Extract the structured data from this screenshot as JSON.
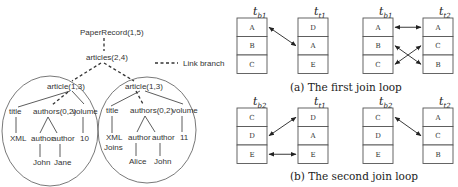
{
  "tree": {
    "root": "PaperRecord(1,5)",
    "articles": "articles(2,4)",
    "legend_label": "Link branch",
    "left": {
      "article": "article(1,3)",
      "title": "title",
      "authors": "authors(0,2)",
      "volume": "volume",
      "title_value": [
        "XML"
      ],
      "author1": "author",
      "author2": "author",
      "volume_value": "10",
      "author1_value": "John",
      "author2_value": "Jane"
    },
    "right": {
      "article": "article(1,3)",
      "title": "title",
      "authors": "authors(0,2)",
      "volume": "volume",
      "title_value": [
        "XML",
        "Joins"
      ],
      "author1": "author",
      "author2": "author",
      "volume_value": "11",
      "author1_value": "Alice",
      "author2_value": "John"
    }
  },
  "join_loops": [
    {
      "caption": "(a) The first join loop",
      "pairs": [
        {
          "left": {
            "name": "t",
            "sub": "b1",
            "rows": [
              "A",
              "B",
              "C"
            ]
          },
          "right": {
            "name": "t",
            "sub": "t1",
            "rows": [
              "D",
              "A",
              "E"
            ]
          },
          "links": [
            [
              0,
              1
            ]
          ]
        },
        {
          "left": {
            "name": "t",
            "sub": "b1",
            "rows": [
              "A",
              "B",
              "C"
            ]
          },
          "right": {
            "name": "t",
            "sub": "t2",
            "rows": [
              "A",
              "C",
              "B"
            ]
          },
          "links": [
            [
              0,
              0
            ],
            [
              1,
              2
            ],
            [
              2,
              1
            ]
          ]
        }
      ]
    },
    {
      "caption": "(b) The second join loop",
      "pairs": [
        {
          "left": {
            "name": "t",
            "sub": "b2",
            "rows": [
              "C",
              "D",
              "E"
            ]
          },
          "right": {
            "name": "t",
            "sub": "t1",
            "rows": [
              "D",
              "A",
              "E"
            ]
          },
          "links": [
            [
              1,
              0
            ],
            [
              2,
              2
            ]
          ]
        },
        {
          "left": {
            "name": "t",
            "sub": "b2",
            "rows": [
              "C",
              "D",
              "E"
            ]
          },
          "right": {
            "name": "t",
            "sub": "t2",
            "rows": [
              "A",
              "C",
              "B"
            ]
          },
          "links": [
            [
              0,
              1
            ]
          ]
        }
      ]
    }
  ]
}
